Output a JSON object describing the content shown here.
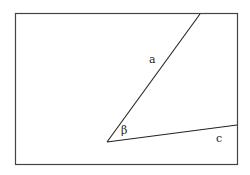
{
  "diagram": {
    "type": "angle-figure",
    "frame": {
      "x": 15,
      "y": 13,
      "width": 223,
      "height": 152,
      "stroke": "#444444"
    },
    "vertex": {
      "x": 107,
      "y": 142
    },
    "segments": [
      {
        "name": "a",
        "x1": 107,
        "y1": 142,
        "x2": 200,
        "y2": 14
      },
      {
        "name": "c",
        "x1": 107,
        "y1": 142,
        "x2": 237,
        "y2": 125
      }
    ],
    "labels": {
      "side_a": "a",
      "side_c": "c",
      "angle": "β"
    },
    "label_positions": {
      "side_a": {
        "x": 149,
        "y": 63
      },
      "side_c": {
        "x": 216,
        "y": 142
      },
      "angle": {
        "x": 121,
        "y": 134
      }
    },
    "line_color": "#222222"
  }
}
